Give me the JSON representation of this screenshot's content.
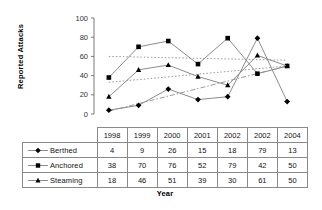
{
  "chart_data": {
    "type": "line",
    "title": "",
    "xlabel": "Year",
    "ylabel": "Reported Attacks",
    "categories": [
      "1998",
      "1999",
      "2000",
      "2001",
      "2002",
      "2002",
      "2004"
    ],
    "ylim": [
      0,
      100
    ],
    "yticks": [
      "0",
      "20",
      "40",
      "60",
      "80",
      "100"
    ],
    "grid": false,
    "legend_position": "table-row-labels",
    "series": [
      {
        "name": "Berthed",
        "marker": "diamond",
        "color": "#000000",
        "values": [
          4,
          9,
          26,
          15,
          18,
          79,
          13
        ],
        "trendline": {
          "style": "dash-dot",
          "start": 3,
          "end": 50
        }
      },
      {
        "name": "Anchored",
        "marker": "square",
        "color": "#000000",
        "values": [
          38,
          70,
          76,
          52,
          79,
          42,
          50
        ],
        "trendline": {
          "style": "dotted",
          "start": 60,
          "end": 56
        }
      },
      {
        "name": "Steaming",
        "marker": "triangle",
        "color": "#000000",
        "values": [
          18,
          46,
          51,
          39,
          30,
          61,
          50
        ],
        "trendline": {
          "style": "dotted",
          "start": 33,
          "end": 50
        }
      }
    ]
  },
  "table": {
    "corner_label": "",
    "column_headers": [
      "1998",
      "1999",
      "2000",
      "2001",
      "2002",
      "2002",
      "2004"
    ],
    "rows": [
      {
        "label": "Berthed",
        "marker": "diamond",
        "values": [
          "4",
          "9",
          "26",
          "15",
          "18",
          "79",
          "13"
        ]
      },
      {
        "label": "Anchored",
        "marker": "square",
        "values": [
          "38",
          "70",
          "76",
          "52",
          "79",
          "42",
          "50"
        ]
      },
      {
        "label": "Steaming",
        "marker": "triangle",
        "values": [
          "18",
          "46",
          "51",
          "39",
          "30",
          "61",
          "50"
        ]
      }
    ]
  },
  "axis_title_x": "Year",
  "axis_title_y": "Reported Attacks"
}
